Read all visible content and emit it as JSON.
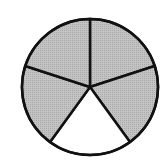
{
  "diagram": {
    "type": "fraction-circle",
    "total_parts": 5,
    "shaded_parts": 4,
    "unshaded_parts": 1,
    "fraction_shaded": "4/5",
    "center": [
      90,
      87
    ],
    "radius": 68,
    "start_angle_deg": -90,
    "shaded_color": "#b8b8b8",
    "unshaded_color": "#ffffff",
    "stroke_color": "#111111",
    "segments": [
      {
        "index": 0,
        "shaded": true
      },
      {
        "index": 1,
        "shaded": true
      },
      {
        "index": 2,
        "shaded": false
      },
      {
        "index": 3,
        "shaded": true
      },
      {
        "index": 4,
        "shaded": true
      }
    ]
  }
}
